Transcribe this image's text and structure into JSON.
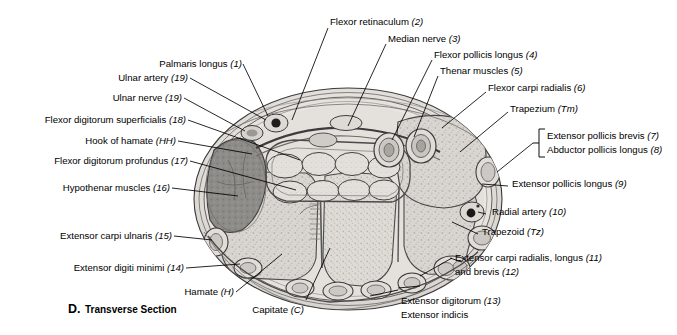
{
  "figure": {
    "caption_letter": "D.",
    "caption_text": "Transverse Section",
    "background_color": "#ffffff",
    "ink_color": "#000000"
  },
  "labels": {
    "palmaris_longus": "Palmaris longus (1)",
    "ulnar_artery": "Ulnar artery (19)",
    "ulnar_nerve": "Ulnar nerve (19)",
    "flexor_digitorum_superficialis": "Flexor digitorum superficialis (18)",
    "hook_of_hamate": "Hook of hamate (HH)",
    "flexor_digitorum_profundus": "Flexor digitorum profundus (17)",
    "hypothenar_muscles": "Hypothenar muscles (16)",
    "extensor_carpi_ulnaris": "Extensor carpi ulnaris (15)",
    "extensor_digiti_minimi": "Extensor digiti minimi (14)",
    "hamate": "Hamate (H)",
    "capitate": "Capitate (C)",
    "flexor_retinaculum": "Flexor retinaculum (2)",
    "median_nerve": "Median nerve (3)",
    "flexor_pollicis_longus": "Flexor pollicis longus (4)",
    "thenar_muscles": "Thenar muscles (5)",
    "flexor_carpi_radialis": "Flexor carpi radialis (6)",
    "trapezium": "Trapezium (Tm)",
    "extensor_pollicis_brevis": "Extensor pollicis brevis (7)",
    "abductor_pollicis_longus": "Abductor pollicis longus (8)",
    "extensor_pollicis_longus": "Extensor pollicis longus (9)",
    "radial_artery": "Radial artery (10)",
    "trapezoid": "Trapezoid (Tz)",
    "extensor_carpi_radialis_longus": "Extensor carpi radialis, longus (11)",
    "extensor_carpi_radialis_brevis": "and brevis (12)",
    "extensor_digitorum": "Extensor digitorum (13)",
    "extensor_indicis": "Extensor indicis"
  },
  "label_italic_parts": {
    "n1": "(1)",
    "n2": "(2)",
    "n3": "(3)",
    "n4": "(4)",
    "n5": "(5)",
    "n6": "(6)",
    "n7": "(7)",
    "n8": "(8)",
    "n9": "(9)",
    "n10": "(10)",
    "n11": "(11)",
    "n12": "(12)",
    "n13": "(13)",
    "n14": "(14)",
    "n15": "(15)",
    "n16": "(16)",
    "n17": "(17)",
    "n18": "(18)",
    "n19": "(19)",
    "hh": "(HH)",
    "h": "(H)",
    "c": "(C)",
    "tm": "(Tm)",
    "tz": "(Tz)"
  }
}
